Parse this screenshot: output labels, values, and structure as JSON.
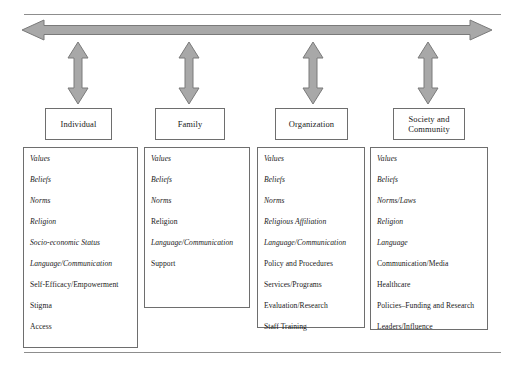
{
  "figure": {
    "title_visible": false,
    "colors": {
      "arrow_fill": "#a8a8a8",
      "arrow_stroke": "#7a7a7a",
      "box_border": "#6e6e6e",
      "rule": "#8d8d8d",
      "text": "#1a1a1a",
      "background": "#ffffff"
    },
    "top_rule_label": "",
    "bottom_rule_label": ""
  },
  "arrows": {
    "horizontal": {
      "name": "bidirectional-horizontal-arrow",
      "direction": "both"
    },
    "vertical": [
      {
        "name": "bidirectional-vertical-arrow-individual",
        "direction": "both"
      },
      {
        "name": "bidirectional-vertical-arrow-family",
        "direction": "both"
      },
      {
        "name": "bidirectional-vertical-arrow-organization",
        "direction": "both"
      },
      {
        "name": "bidirectional-vertical-arrow-society",
        "direction": "both"
      }
    ]
  },
  "levels": [
    {
      "id": "individual",
      "label": "Individual",
      "items": [
        {
          "text": "Values",
          "italic": true
        },
        {
          "text": "Beliefs",
          "italic": true
        },
        {
          "text": "Norms",
          "italic": true
        },
        {
          "text": "Religion",
          "italic": true
        },
        {
          "text": "Socio-economic Status",
          "italic": true
        },
        {
          "text": "Language/Communication",
          "italic": true
        },
        {
          "text": "Self-Efficacy/Empowerment",
          "italic": false
        },
        {
          "text": "Stigma",
          "italic": false
        },
        {
          "text": "Access",
          "italic": false
        }
      ]
    },
    {
      "id": "family",
      "label": "Family",
      "items": [
        {
          "text": "Values",
          "italic": true
        },
        {
          "text": "Beliefs",
          "italic": true
        },
        {
          "text": "Norms",
          "italic": true
        },
        {
          "text": "Religion",
          "italic": false
        },
        {
          "text": "Language/Communication",
          "italic": true
        },
        {
          "text": "Support",
          "italic": false
        }
      ]
    },
    {
      "id": "organization",
      "label": "Organization",
      "items": [
        {
          "text": "Values",
          "italic": true
        },
        {
          "text": "Beliefs",
          "italic": true
        },
        {
          "text": "Norms",
          "italic": true
        },
        {
          "text": "Religious Affiliation",
          "italic": true
        },
        {
          "text": "Language/Communication",
          "italic": true
        },
        {
          "text": "Policy and Procedures",
          "italic": false
        },
        {
          "text": "Services/Programs",
          "italic": false
        },
        {
          "text": "Evaluation/Research",
          "italic": false
        },
        {
          "text": "Staff Training",
          "italic": false
        }
      ]
    },
    {
      "id": "society-and-community",
      "label": "Society and Community",
      "label_lines": [
        "Society and",
        "Community"
      ],
      "items": [
        {
          "text": "Values",
          "italic": true
        },
        {
          "text": "Beliefs",
          "italic": true
        },
        {
          "text": "Norms/Laws",
          "italic": true
        },
        {
          "text": "Religion",
          "italic": true
        },
        {
          "text": "Language",
          "italic": true
        },
        {
          "text": "Communication/Media",
          "italic": false
        },
        {
          "text": "Healthcare",
          "italic": false
        },
        {
          "text": "Policies–Funding and Research",
          "italic": false
        },
        {
          "text": "Leaders/Influence",
          "italic": false
        }
      ]
    }
  ]
}
